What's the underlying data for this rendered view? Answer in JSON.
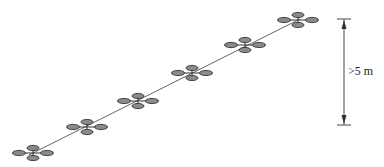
{
  "diagram": {
    "type": "drone-formation-ascending-line",
    "colors": {
      "rotor_fill": "#8a8a8a",
      "rotor_stroke": "#333333",
      "line": "#555555",
      "dimension": "#333333"
    },
    "drones": [
      {
        "id": 1,
        "x": 33,
        "y": 153
      },
      {
        "id": 2,
        "x": 87,
        "y": 127
      },
      {
        "id": 3,
        "x": 138,
        "y": 101
      },
      {
        "id": 4,
        "x": 192,
        "y": 73
      },
      {
        "id": 5,
        "x": 245,
        "y": 45
      },
      {
        "id": 6,
        "x": 298,
        "y": 20
      }
    ],
    "dimension": {
      "x": 344,
      "y_top": 19,
      "y_bottom": 125,
      "label": ">5 m"
    }
  }
}
